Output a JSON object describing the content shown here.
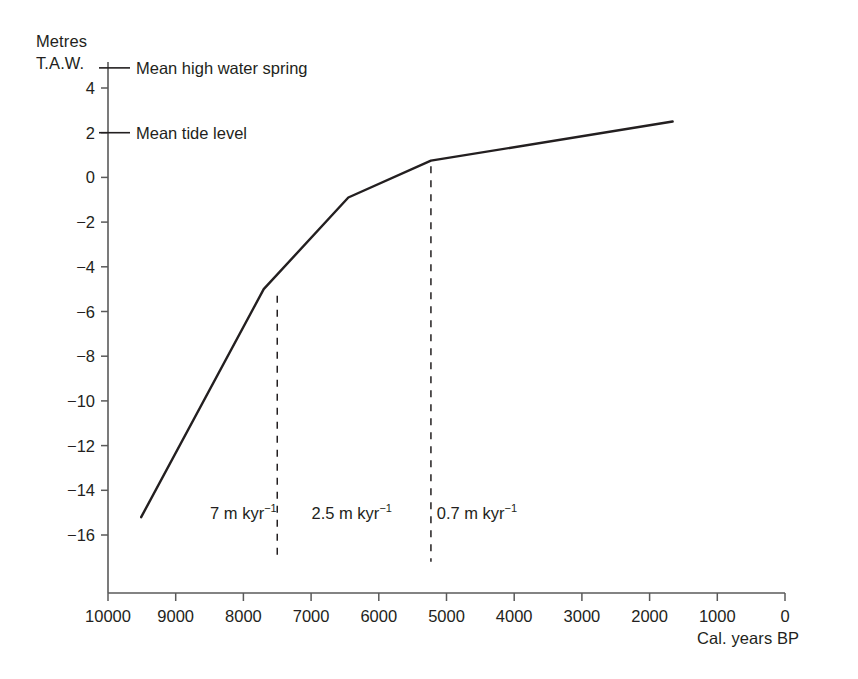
{
  "chart_data": {
    "type": "line",
    "title": "",
    "xlabel": "Cal. years BP",
    "ylabel_line1": "Metres",
    "ylabel_line2": "T.A.W.",
    "xlim": [
      10000,
      0
    ],
    "ylim": [
      -17.2,
      5.4
    ],
    "x_reversed": true,
    "grid": false,
    "legend": "none",
    "x_ticks": [
      10000,
      9000,
      8000,
      7000,
      6000,
      5000,
      4000,
      3000,
      2000,
      1000,
      0
    ],
    "x_tick_labels": [
      "10000",
      "9000",
      "8000",
      "7000",
      "6000",
      "5000",
      "4000",
      "3000",
      "2000",
      "1000",
      "0"
    ],
    "y_ticks": [
      4,
      2,
      0,
      -2,
      -4,
      -6,
      -8,
      -10,
      -12,
      -14,
      -16
    ],
    "y_tick_labels": [
      "4",
      "2",
      "0",
      "−2",
      "−4",
      "−6",
      "−8",
      "−10",
      "−12",
      "−14",
      "−16"
    ],
    "series": [
      {
        "name": "Relative sea-level curve",
        "color": "#231f20",
        "x": [
          9510,
          7700,
          6450,
          5230,
          1660
        ],
        "y": [
          -15.2,
          -5.0,
          -0.9,
          0.75,
          2.5
        ]
      }
    ],
    "reference_levels": [
      {
        "name": "mean-high-water-spring",
        "label": "Mean high water spring",
        "value": 4.9
      },
      {
        "name": "mean-tide-level",
        "label": "Mean tide level",
        "value": 2.0
      }
    ],
    "segment_dividers": [
      {
        "name": "divider-7500",
        "x": 7500,
        "y_top": -5.3,
        "y_bottom": -17.2
      },
      {
        "name": "divider-5230",
        "x": 5230,
        "y_top": 0.5,
        "y_bottom": -17.2
      }
    ],
    "rate_annotations": [
      {
        "name": "rate-7",
        "value": "7",
        "unit_m": " m kyr",
        "exponent": "−1",
        "x": 8000,
        "y": -15.0
      },
      {
        "name": "rate-2-5",
        "value": "2.5",
        "unit_m": " m kyr",
        "exponent": "−1",
        "x": 6400,
        "y": -15.0
      },
      {
        "name": "rate-0-7",
        "value": "0.7",
        "unit_m": " m kyr",
        "exponent": "−1",
        "x": 4550,
        "y": -15.0
      }
    ],
    "axis_color": "#5a5a5a",
    "line_color": "#231f20"
  }
}
